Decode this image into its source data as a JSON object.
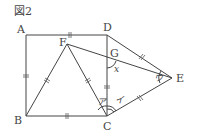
{
  "figure": {
    "title": "図2",
    "points": {
      "A": {
        "label": "A",
        "x": 26,
        "y": 35
      },
      "D": {
        "label": "D",
        "x": 107,
        "y": 35
      },
      "B": {
        "label": "B",
        "x": 26,
        "y": 116
      },
      "C": {
        "label": "C",
        "x": 107,
        "y": 116
      },
      "F": {
        "label": "F",
        "x": 67,
        "y": 44
      },
      "G": {
        "label": "G",
        "x": 107,
        "y": 58
      },
      "E": {
        "label": "E",
        "x": 172,
        "y": 78
      }
    },
    "angles": {
      "x": "x",
      "a": "ア",
      "i": "イ",
      "u": "ウ"
    }
  }
}
